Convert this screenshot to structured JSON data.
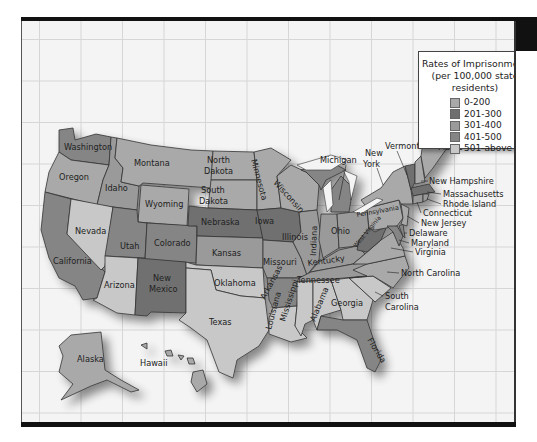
{
  "legend": {
    "title_line1": "Rates of Imprisonment",
    "title_line2": "(per 100,000 state residents)",
    "items": [
      {
        "label": "0-200",
        "color": "#a9a9a9"
      },
      {
        "label": "201-300",
        "color": "#6f6f6f"
      },
      {
        "label": "301-400",
        "color": "#9a9a9a"
      },
      {
        "label": "401-500",
        "color": "#858585"
      },
      {
        "label": "501-above",
        "color": "#c8c8c8"
      }
    ]
  },
  "states": {
    "washington": "Washington",
    "oregon": "Oregon",
    "california": "California",
    "idaho": "Idaho",
    "nevada": "Nevada",
    "montana": "Montana",
    "wyoming": "Wyoming",
    "utah": "Utah",
    "arizona": "Arizona",
    "colorado": "Colorado",
    "new_mexico_1": "New",
    "new_mexico_2": "Mexico",
    "north_dakota_1": "North",
    "north_dakota_2": "Dakota",
    "south_dakota_1": "South",
    "south_dakota_2": "Dakota",
    "nebraska": "Nebraska",
    "kansas": "Kansas",
    "oklahoma": "Oklahoma",
    "texas": "Texas",
    "minnesota": "Minnesota",
    "iowa": "Iowa",
    "missouri": "Missouri",
    "arkansas": "Arkansas",
    "louisiana": "Louisiana",
    "wisconsin": "Wisconsin",
    "illinois": "Illinois",
    "michigan": "Michigan",
    "indiana": "Indiana",
    "ohio": "Ohio",
    "kentucky": "Kentucky",
    "tennessee": "Tennessee",
    "mississippi": "Mississippi",
    "alabama": "Alabama",
    "georgia": "Georgia",
    "florida": "Florida",
    "south_carolina_1": "South",
    "south_carolina_2": "Carolina",
    "north_carolina": "North Carolina",
    "virginia": "Virginia",
    "west_virginia": "West Virginia",
    "pennsylvania": "Pennsylvania",
    "new_york_1": "New",
    "new_york_2": "York",
    "vermont": "Vermont",
    "maine": "Maine",
    "new_hampshire": "New Hampshire",
    "massachusetts": "Massachusetts",
    "rhode_island": "Rhode Island",
    "connecticut": "Connecticut",
    "new_jersey": "New Jersey",
    "delaware": "Delaware",
    "maryland": "Maryland",
    "alaska": "Alaska",
    "hawaii": "Hawaii"
  }
}
